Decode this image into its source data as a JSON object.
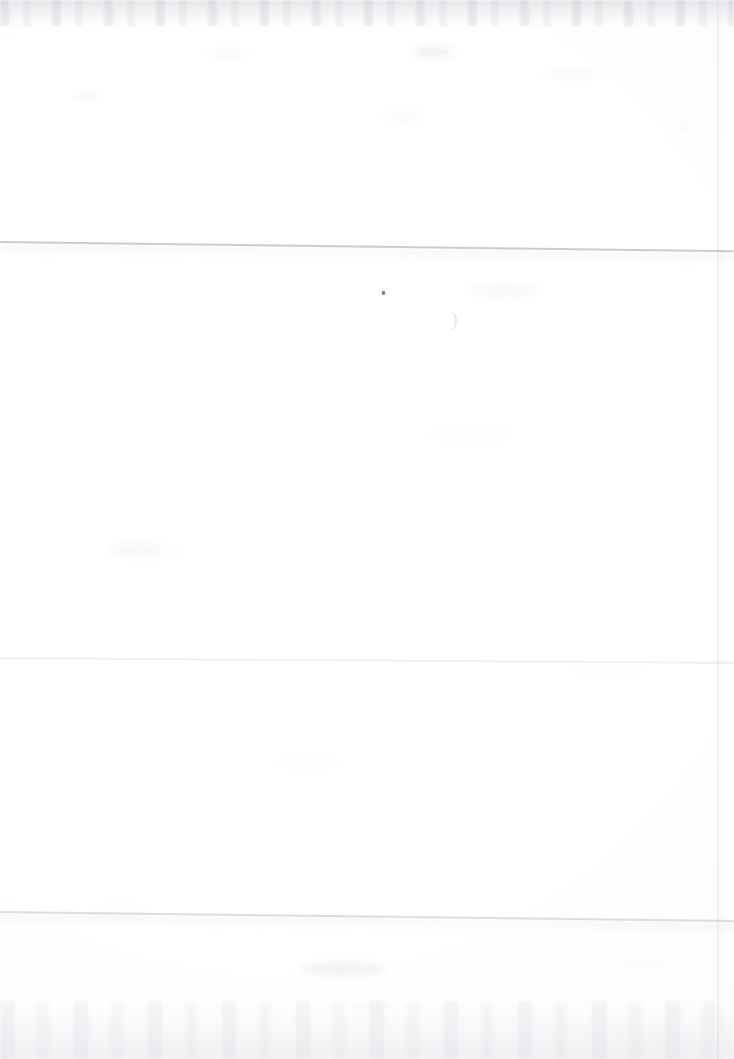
{
  "document": {
    "kind": "scanned-page",
    "page_content": "",
    "page_note": "",
    "visible_text": ""
  },
  "canvas": {
    "width_px": 734,
    "height_px": 1059,
    "paper_color": "#ffffff",
    "paper_tint": "#fbfbfc"
  },
  "artifacts": {
    "fold_lines": [
      {
        "name": "upper-crease",
        "top_px": 241,
        "left_end_y_px": 241,
        "right_end_y_px": 250,
        "tilt_deg": 0.72,
        "color": "#787c8a",
        "intensity": "strong"
      },
      {
        "name": "middle-crease",
        "top_px": 657,
        "left_end_y_px": 657,
        "right_end_y_px": 662,
        "tilt_deg": 0.38,
        "color": "#c4c7d0",
        "intensity": "very-faint"
      },
      {
        "name": "lower-crease",
        "top_px": 911,
        "left_end_y_px": 911,
        "right_end_y_px": 920,
        "tilt_deg": 0.7,
        "color": "#969aa6",
        "intensity": "medium"
      }
    ],
    "page_right_edge": {
      "name": "page-right-edge",
      "left_px": 717,
      "color": "#cdcfd6"
    },
    "edge_smudges": [
      {
        "name": "top-edge-smudge",
        "height_px": 26,
        "color": "#b0b2bc"
      },
      {
        "name": "bottom-edge-smudge",
        "height_px": 58,
        "color": "#bcbec8"
      }
    ],
    "specks": [
      {
        "name": "ink-speck",
        "x_px": 382,
        "y_px": 291,
        "color": "#5f6270"
      }
    ],
    "bleed_through": [
      {
        "name": "paren-bleed",
        "glyph": ")",
        "x_px": 451,
        "y_px": 309,
        "color": "#d4d6de"
      }
    ]
  }
}
